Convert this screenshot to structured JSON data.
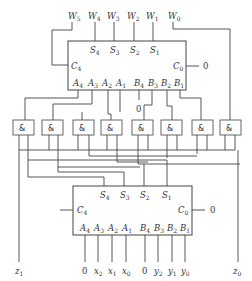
{
  "top_outputs": [
    "W5",
    "W4",
    "W3",
    "W2",
    "W1",
    "W0"
  ],
  "top_adder": {
    "sum_pins": [
      "S4",
      "S3",
      "S2",
      "S1"
    ],
    "carry_out": "C4",
    "carry_in": "C0",
    "carry_in_value": "0",
    "a_pins": [
      "A4",
      "A3",
      "A2",
      "A1"
    ],
    "b_pins": [
      "B4",
      "B3",
      "B2",
      "B1"
    ],
    "b4_constant": "0"
  },
  "gates": {
    "count": 8,
    "symbol": "&"
  },
  "bottom_adder": {
    "sum_pins": [
      "S4",
      "S3",
      "S2",
      "S1"
    ],
    "carry_out": "C4",
    "carry_in": "C0",
    "carry_in_value": "0",
    "a_pins": [
      "A4",
      "A3",
      "A2",
      "A1"
    ],
    "b_pins": [
      "B4",
      "B3",
      "B2",
      "B1"
    ]
  },
  "inputs": {
    "a": [
      "0",
      "x2",
      "x1",
      "x0"
    ],
    "b": [
      "0",
      "y2",
      "y1",
      "y0"
    ]
  },
  "side_outputs": {
    "left": "z1",
    "right": "z0"
  }
}
